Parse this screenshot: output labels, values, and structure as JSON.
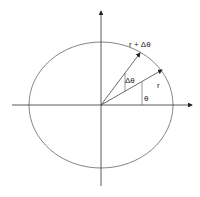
{
  "diagram": {
    "type": "polar-coordinates-ellipse",
    "labels": {
      "r_plus_dtheta": "r + Δθ",
      "r": "r",
      "dtheta": "Δθ",
      "theta": "θ"
    },
    "colors": {
      "stroke": "#555555",
      "axis": "#333333",
      "text": "#222222"
    }
  }
}
